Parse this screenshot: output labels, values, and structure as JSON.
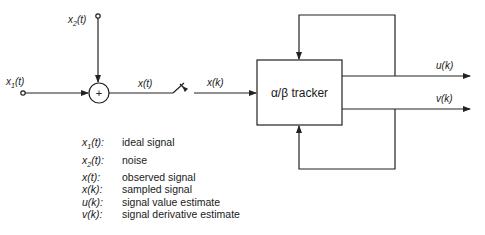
{
  "diagram": {
    "inputs": {
      "x1": {
        "base": "x",
        "sub": "1",
        "arg": "(t)"
      },
      "x2": {
        "base": "x",
        "sub": "2",
        "arg": "(t)"
      }
    },
    "summing_junction": {
      "symbol": "+"
    },
    "signals": {
      "xt": "x(t)",
      "xk": "x(k)",
      "uk": "u(k)",
      "vk": "v(k)"
    },
    "block": {
      "label": "α/β tracker"
    },
    "legend": [
      {
        "base": "x",
        "sub": "1",
        "arg": "(t):",
        "desc": "ideal signal"
      },
      {
        "base": "x",
        "sub": "2",
        "arg": "(t):",
        "desc": "noise"
      },
      {
        "base": "x",
        "sub": "",
        "arg": "(t):",
        "desc": "observed signal"
      },
      {
        "base": "x",
        "sub": "",
        "arg": "(k):",
        "desc": "sampled signal"
      },
      {
        "base": "u",
        "sub": "",
        "arg": "(k):",
        "desc": "signal value estimate"
      },
      {
        "base": "v",
        "sub": "",
        "arg": "(k):",
        "desc": "signal derivative estimate"
      }
    ],
    "colors": {
      "line": "#222222",
      "background": "#ffffff"
    }
  }
}
